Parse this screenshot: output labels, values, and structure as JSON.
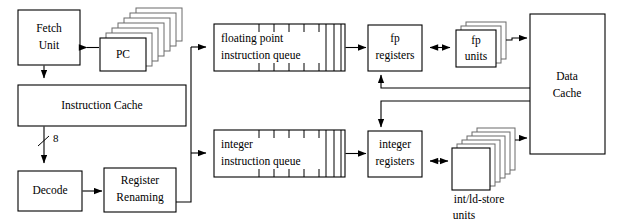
{
  "diagram": {
    "background_color": "#ffffff",
    "line_color": "#000000",
    "text_color": "#000000",
    "width": 622,
    "height": 223,
    "blocks": {
      "fetch_unit": {
        "label_line1": "Fetch",
        "label_line2": "Unit"
      },
      "pc": {
        "label": "PC",
        "stack_count": 7
      },
      "instruction_cache": {
        "label": "Instruction Cache"
      },
      "decode": {
        "label": "Decode"
      },
      "register_renaming": {
        "label_line1": "Register",
        "label_line2": "Renaming"
      },
      "fp_queue": {
        "label_line1": "floating point",
        "label_line2": "instruction queue"
      },
      "integer_queue": {
        "label_line1": "integer",
        "label_line2": "instruction queue"
      },
      "fp_registers": {
        "label_line1": "fp",
        "label_line2": "registers"
      },
      "integer_registers": {
        "label_line1": "integer",
        "label_line2": "registers"
      },
      "fp_units": {
        "label_line1": "fp",
        "label_line2": "units",
        "stack_count": 3
      },
      "int_ld_store_units": {
        "label_line1": "int/ld-store",
        "label_line2": "units",
        "stack_count": 6
      },
      "data_cache": {
        "label_line1": "Data",
        "label_line2": "Cache"
      }
    },
    "edge_labels": {
      "icache_to_decode_width": "8"
    }
  }
}
